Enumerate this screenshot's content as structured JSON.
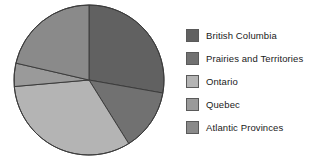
{
  "chart_data": {
    "type": "pie",
    "title": "",
    "subtitle": "",
    "xlabel": "",
    "ylabel": "",
    "grid": false,
    "legend_position": "right",
    "start_angle_deg_from_12oclock": 0,
    "direction": "clockwise",
    "center": {
      "x": 89,
      "y": 80
    },
    "radius": 75,
    "categories": [
      "British Columbia",
      "Prairies and Territories",
      "Ontario",
      "Quebec",
      "Atlantic Provinces"
    ],
    "values": [
      27.8,
      13.3,
      32.5,
      5.0,
      21.4
    ],
    "slices": [
      {
        "label": "British Columbia",
        "value": 27.8,
        "start_deg": 0,
        "end_deg": 100,
        "color": "#616161",
        "edge_color": "#3c3c3c"
      },
      {
        "label": "Prairies and Territories",
        "value": 13.3,
        "start_deg": 100,
        "end_deg": 148,
        "color": "#717171",
        "edge_color": "#3c3c3c"
      },
      {
        "label": "Ontario",
        "value": 32.5,
        "start_deg": 148,
        "end_deg": 265,
        "color": "#b4b4b4",
        "edge_color": "#3c3c3c"
      },
      {
        "label": "Quebec",
        "value": 5.0,
        "start_deg": 265,
        "end_deg": 283,
        "color": "#9a9a9a",
        "edge_color": "#3c3c3c"
      },
      {
        "label": "Atlantic Provinces",
        "value": 21.4,
        "start_deg": 283,
        "end_deg": 360,
        "color": "#8a8a8a",
        "edge_color": "#3c3c3c"
      }
    ]
  },
  "legend": {
    "items": [
      {
        "label": "British Columbia",
        "color": "#616161"
      },
      {
        "label": "Prairies and Territories",
        "color": "#717171"
      },
      {
        "label": "Ontario",
        "color": "#b4b4b4"
      },
      {
        "label": "Quebec",
        "color": "#9a9a9a"
      },
      {
        "label": "Atlantic Provinces",
        "color": "#8a8a8a"
      }
    ]
  },
  "colors": {
    "background": "#ffffff",
    "text": "#1a1a1a",
    "outline": "#3c3c3c"
  }
}
